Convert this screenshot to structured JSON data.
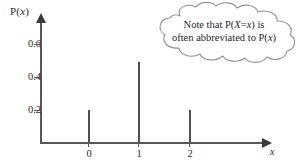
{
  "figure": {
    "y_axis": {
      "title_prefix": "P(",
      "title_var": "x",
      "title_suffix": ")",
      "ticks": [
        {
          "label": "0.6",
          "value": 0.6
        },
        {
          "label": "0.4",
          "value": 0.4
        },
        {
          "label": "0.2",
          "value": 0.2
        }
      ]
    },
    "x_axis": {
      "title": "x",
      "ticks": [
        {
          "label": "0",
          "value": 0
        },
        {
          "label": "1",
          "value": 1
        },
        {
          "label": "2",
          "value": 2
        }
      ]
    },
    "callout": {
      "line1_prefix": "Note that P(",
      "line1_var1": "X",
      "line1_mid": "=",
      "line1_var2": "x",
      "line1_suffix": ") is",
      "line2_prefix": "often abbreviated to P(",
      "line2_var": "x",
      "line2_suffix": ")"
    },
    "colors": {
      "axis": "#555759",
      "spike": "#4d4f51",
      "cloud_stroke": "#8d8f92",
      "text": "#2b2b2b",
      "background": "#ffffff"
    }
  },
  "chart_data": {
    "type": "bar",
    "title": "",
    "subtitle": "",
    "xlabel": "x",
    "ylabel": "P(x)",
    "categories": [
      "0",
      "1",
      "2"
    ],
    "x": [
      0,
      1,
      2
    ],
    "values": [
      0.2,
      0.5,
      0.2
    ],
    "series": [
      {
        "name": "P(X=x)",
        "values": [
          0.2,
          0.5,
          0.2
        ]
      }
    ],
    "xlim": [
      -0.75,
      3.5
    ],
    "ylim": [
      0,
      0.72
    ],
    "ytick_values": [
      0.2,
      0.4,
      0.6
    ],
    "ytick_labels": [
      "0.2",
      "0.4",
      "0.6"
    ],
    "xtick_values": [
      0,
      1,
      2
    ],
    "xtick_labels": [
      "0",
      "1",
      "2"
    ],
    "grid": false,
    "legend": null,
    "annotations": [
      {
        "text": "Note that P(X=x) is often abbreviated to P(x)",
        "shape": "cloud",
        "position": "top-right"
      }
    ],
    "style": "stem/spike plot of a discrete probability distribution"
  }
}
